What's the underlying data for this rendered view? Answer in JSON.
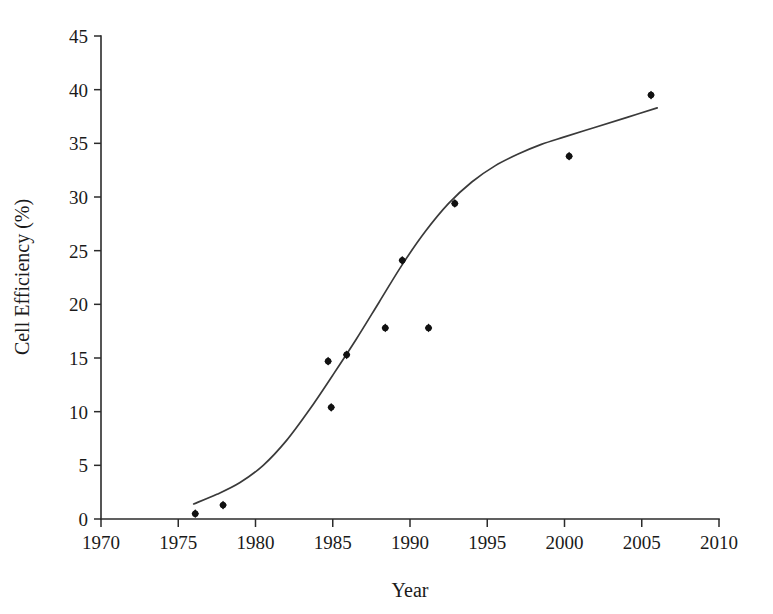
{
  "chart_data": {
    "type": "scatter",
    "title": "",
    "xlabel": "Year",
    "ylabel": "Cell Efficiency (%)",
    "xlim": [
      1970,
      2010
    ],
    "ylim": [
      0,
      45
    ],
    "xticks": [
      1970,
      1975,
      1980,
      1985,
      1990,
      1995,
      2000,
      2005,
      2010
    ],
    "xtick_labels": [
      "1970",
      "1975",
      "1980",
      "1985",
      "1990",
      "1995",
      "2000",
      "2005",
      "2010"
    ],
    "yticks": [
      0,
      5,
      10,
      15,
      20,
      25,
      30,
      35,
      40,
      45
    ],
    "ytick_labels": [
      "0",
      "5",
      "10",
      "15",
      "20",
      "25",
      "30",
      "35",
      "40",
      "45"
    ],
    "grid": false,
    "legend": null,
    "series": [
      {
        "name": "Measured cell efficiency",
        "marker": "diamond",
        "color": "#111111",
        "points": [
          {
            "x": 1976.1,
            "y": 0.5
          },
          {
            "x": 1977.9,
            "y": 1.3
          },
          {
            "x": 1984.7,
            "y": 14.7
          },
          {
            "x": 1984.9,
            "y": 10.4
          },
          {
            "x": 1985.9,
            "y": 15.3
          },
          {
            "x": 1988.4,
            "y": 17.8
          },
          {
            "x": 1989.5,
            "y": 24.1
          },
          {
            "x": 1991.2,
            "y": 17.8
          },
          {
            "x": 1992.9,
            "y": 29.4
          },
          {
            "x": 2000.3,
            "y": 33.8
          },
          {
            "x": 2005.6,
            "y": 39.5
          }
        ]
      },
      {
        "name": "Fitted trend curve",
        "marker": "none",
        "color": "#3a3a3a",
        "points": [
          {
            "x": 1976.0,
            "y": 1.4
          },
          {
            "x": 1977.5,
            "y": 2.3
          },
          {
            "x": 1979.0,
            "y": 3.4
          },
          {
            "x": 1980.5,
            "y": 5.0
          },
          {
            "x": 1982.0,
            "y": 7.3
          },
          {
            "x": 1983.5,
            "y": 10.2
          },
          {
            "x": 1985.0,
            "y": 13.4
          },
          {
            "x": 1986.5,
            "y": 16.7
          },
          {
            "x": 1988.0,
            "y": 20.2
          },
          {
            "x": 1989.5,
            "y": 23.7
          },
          {
            "x": 1991.0,
            "y": 26.8
          },
          {
            "x": 1992.5,
            "y": 29.4
          },
          {
            "x": 1994.0,
            "y": 31.4
          },
          {
            "x": 1995.5,
            "y": 32.9
          },
          {
            "x": 1997.0,
            "y": 34.0
          },
          {
            "x": 1998.5,
            "y": 34.9
          },
          {
            "x": 2000.0,
            "y": 35.6
          },
          {
            "x": 2002.0,
            "y": 36.5
          },
          {
            "x": 2004.0,
            "y": 37.4
          },
          {
            "x": 2006.0,
            "y": 38.3
          }
        ]
      }
    ]
  },
  "plot_geometry": {
    "x_pixel_min": 101,
    "x_pixel_max": 719,
    "y_pixel_min": 519,
    "y_pixel_max": 36
  }
}
